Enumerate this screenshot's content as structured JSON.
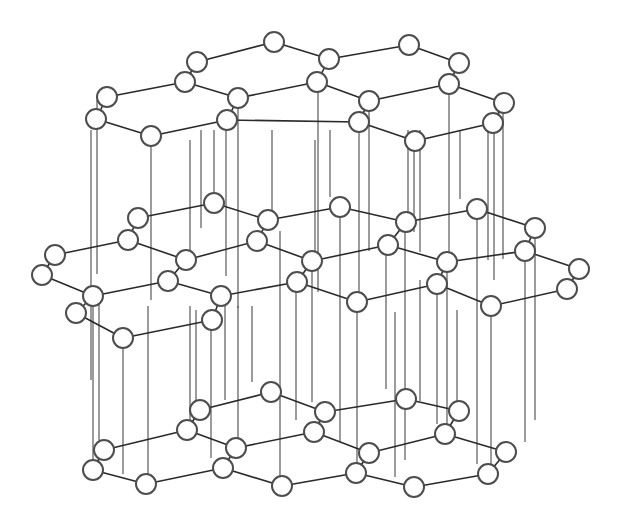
{
  "colors": {
    "background": "#ffffff",
    "atom_fill": "#ffffff",
    "atom_stroke": "#4d4d4d",
    "bond": "#2a2a2a",
    "interlayer_line": "#4a4a4a"
  },
  "layers": [
    {
      "name": "top",
      "atoms": [
        [
          274,
          42
        ],
        [
          197,
          62
        ],
        [
          185,
          82
        ],
        [
          107,
          97
        ],
        [
          96,
          119
        ],
        [
          238,
          98
        ],
        [
          227,
          120
        ],
        [
          151,
          136
        ],
        [
          329,
          59
        ],
        [
          317,
          82
        ],
        [
          409,
          45
        ],
        [
          459,
          63
        ],
        [
          449,
          84
        ],
        [
          369,
          101
        ],
        [
          359,
          122
        ],
        [
          504,
          103
        ],
        [
          493,
          123
        ],
        [
          415,
          141
        ]
      ],
      "bonds": [
        [
          1,
          0
        ],
        [
          0,
          8
        ],
        [
          3,
          2
        ],
        [
          2,
          5
        ],
        [
          4,
          7
        ],
        [
          7,
          6
        ],
        [
          6,
          14
        ],
        [
          8,
          10
        ],
        [
          10,
          11
        ],
        [
          9,
          13
        ],
        [
          13,
          12
        ],
        [
          12,
          15
        ],
        [
          14,
          17
        ],
        [
          17,
          16
        ],
        [
          5,
          9
        ],
        [
          1,
          2
        ],
        [
          3,
          4
        ],
        [
          5,
          6
        ],
        [
          8,
          9
        ],
        [
          11,
          12
        ],
        [
          13,
          14
        ],
        [
          15,
          16
        ]
      ]
    },
    {
      "name": "middle",
      "atoms": [
        [
          214,
          203
        ],
        [
          138,
          218
        ],
        [
          128,
          240
        ],
        [
          55,
          255
        ],
        [
          42,
          275
        ],
        [
          268,
          220
        ],
        [
          257,
          241
        ],
        [
          186,
          260
        ],
        [
          168,
          281
        ],
        [
          93,
          296
        ],
        [
          221,
          296
        ],
        [
          76,
          313
        ],
        [
          212,
          320
        ],
        [
          123,
          338
        ],
        [
          340,
          207
        ],
        [
          406,
          222
        ],
        [
          388,
          245
        ],
        [
          312,
          261
        ],
        [
          297,
          282
        ],
        [
          357,
          302
        ],
        [
          477,
          209
        ],
        [
          535,
          228
        ],
        [
          525,
          251
        ],
        [
          447,
          262
        ],
        [
          437,
          284
        ],
        [
          579,
          269
        ],
        [
          567,
          289
        ],
        [
          491,
          306
        ]
      ],
      "bonds": [
        [
          1,
          0
        ],
        [
          0,
          5
        ],
        [
          3,
          2
        ],
        [
          2,
          7
        ],
        [
          4,
          9
        ],
        [
          9,
          8
        ],
        [
          7,
          6
        ],
        [
          8,
          10
        ],
        [
          11,
          13
        ],
        [
          13,
          12
        ],
        [
          5,
          14
        ],
        [
          14,
          15
        ],
        [
          6,
          17
        ],
        [
          17,
          16
        ],
        [
          10,
          18
        ],
        [
          18,
          19
        ],
        [
          15,
          20
        ],
        [
          20,
          21
        ],
        [
          16,
          23
        ],
        [
          23,
          22
        ],
        [
          19,
          24
        ],
        [
          24,
          27
        ],
        [
          27,
          26
        ],
        [
          22,
          25
        ],
        [
          1,
          2
        ],
        [
          3,
          4
        ],
        [
          5,
          6
        ],
        [
          7,
          8
        ],
        [
          9,
          11
        ],
        [
          10,
          12
        ],
        [
          15,
          16
        ],
        [
          17,
          18
        ],
        [
          21,
          22
        ],
        [
          23,
          24
        ],
        [
          25,
          26
        ]
      ]
    },
    {
      "name": "bottom",
      "atoms": [
        [
          271,
          392
        ],
        [
          200,
          410
        ],
        [
          187,
          430
        ],
        [
          104,
          450
        ],
        [
          93,
          470
        ],
        [
          236,
          448
        ],
        [
          223,
          468
        ],
        [
          146,
          484
        ],
        [
          282,
          486
        ],
        [
          325,
          412
        ],
        [
          314,
          432
        ],
        [
          406,
          399
        ],
        [
          459,
          411
        ],
        [
          445,
          434
        ],
        [
          369,
          453
        ],
        [
          356,
          473
        ],
        [
          506,
          452
        ],
        [
          488,
          474
        ],
        [
          414,
          487
        ]
      ],
      "bonds": [
        [
          1,
          0
        ],
        [
          0,
          9
        ],
        [
          3,
          2
        ],
        [
          2,
          5
        ],
        [
          4,
          7
        ],
        [
          7,
          6
        ],
        [
          6,
          8
        ],
        [
          8,
          15
        ],
        [
          5,
          10
        ],
        [
          10,
          14
        ],
        [
          9,
          11
        ],
        [
          11,
          12
        ],
        [
          14,
          13
        ],
        [
          13,
          16
        ],
        [
          15,
          18
        ],
        [
          18,
          17
        ],
        [
          1,
          2
        ],
        [
          3,
          4
        ],
        [
          5,
          6
        ],
        [
          9,
          10
        ],
        [
          12,
          13
        ],
        [
          14,
          15
        ],
        [
          16,
          17
        ]
      ]
    }
  ],
  "interlayer_lines": [
    [
      91,
      130,
      380
    ],
    [
      97,
      100,
      274
    ],
    [
      151,
      146,
      300
    ],
    [
      190,
      140,
      252
    ],
    [
      201,
      130,
      228
    ],
    [
      214,
      130,
      192
    ],
    [
      226,
      130,
      276
    ],
    [
      238,
      108,
      308
    ],
    [
      272,
      130,
      212
    ],
    [
      315,
      140,
      251
    ],
    [
      318,
      92,
      292
    ],
    [
      330,
      130,
      197
    ],
    [
      359,
      132,
      292
    ],
    [
      369,
      111,
      251
    ],
    [
      408,
      130,
      214
    ],
    [
      414,
      150,
      232
    ],
    [
      420,
      130,
      252
    ],
    [
      449,
      94,
      252
    ],
    [
      460,
      130,
      199
    ],
    [
      488,
      130,
      260
    ],
    [
      494,
      133,
      280
    ],
    [
      503,
      113,
      259
    ],
    [
      93,
      306,
      460
    ],
    [
      99,
      290,
      440
    ],
    [
      123,
      348,
      474
    ],
    [
      148,
      306,
      474
    ],
    [
      190,
      306,
      420
    ],
    [
      196,
      310,
      400
    ],
    [
      211,
      330,
      458
    ],
    [
      225,
      306,
      400
    ],
    [
      238,
      306,
      438
    ],
    [
      252,
      306,
      382
    ],
    [
      280,
      231,
      476
    ],
    [
      296,
      292,
      420
    ],
    [
      312,
      271,
      402
    ],
    [
      340,
      217,
      442
    ],
    [
      357,
      312,
      463
    ],
    [
      386,
      255,
      389
    ],
    [
      395,
      312,
      477
    ],
    [
      405,
      232,
      460
    ],
    [
      420,
      280,
      401
    ],
    [
      437,
      294,
      424
    ],
    [
      447,
      272,
      424
    ],
    [
      457,
      310,
      401
    ],
    [
      477,
      219,
      464
    ],
    [
      491,
      316,
      464
    ],
    [
      525,
      261,
      442
    ],
    [
      535,
      238,
      420
    ]
  ]
}
